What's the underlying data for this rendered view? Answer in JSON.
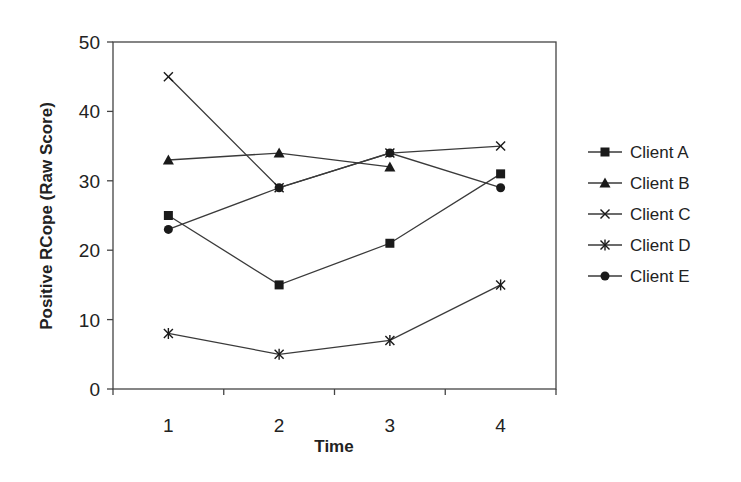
{
  "chart_data": {
    "type": "line",
    "title": "",
    "xlabel": "Time",
    "ylabel": "Positive RCope (Raw Score)",
    "categories": [
      "1",
      "2",
      "3",
      "4"
    ],
    "ylim": [
      0,
      50
    ],
    "yticks": [
      0,
      10,
      20,
      30,
      40,
      50
    ],
    "grid": false,
    "legend_position": "right",
    "series": [
      {
        "name": "Client A",
        "marker": "square",
        "values": [
          25,
          15,
          21,
          31
        ]
      },
      {
        "name": "Client B",
        "marker": "triangle",
        "values": [
          33,
          34,
          32,
          null
        ]
      },
      {
        "name": "Client C",
        "marker": "x",
        "values": [
          45,
          29,
          34,
          35
        ]
      },
      {
        "name": "Client D",
        "marker": "asterisk",
        "values": [
          8,
          5,
          7,
          15
        ]
      },
      {
        "name": "Client E",
        "marker": "circle",
        "values": [
          23,
          29,
          34,
          29
        ]
      }
    ]
  },
  "colors": {
    "line": "#3a3a3a",
    "marker": "#1a1a1a",
    "axis": "#444444",
    "background": "#ffffff"
  }
}
